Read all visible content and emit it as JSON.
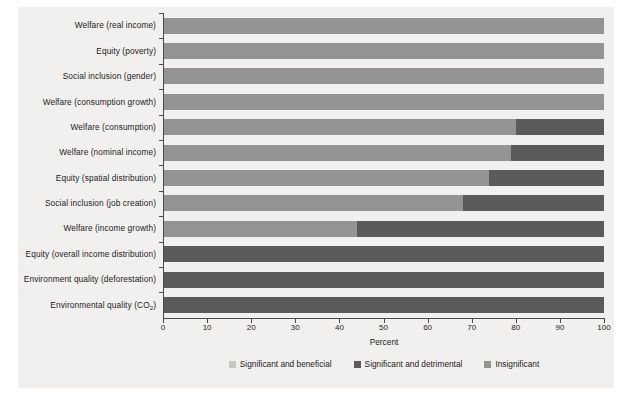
{
  "chart_data": {
    "type": "bar",
    "orientation": "horizontal",
    "stacked": true,
    "title": "",
    "xlabel": "Percent",
    "ylabel": "",
    "xlim": [
      0,
      100
    ],
    "xticks": [
      0,
      10,
      20,
      30,
      40,
      50,
      60,
      70,
      80,
      90,
      100
    ],
    "grid": false,
    "legend_position": "bottom-center",
    "categories": [
      "Welfare (real income)",
      "Equity (poverty)",
      "Social inclusion (gender)",
      "Welfare (consumption growth)",
      "Welfare (consumption)",
      "Welfare (nominal income)",
      "Equity (spatial distribution)",
      "Social inclusion (job creation)",
      "Welfare (income growth)",
      "Equity (overall income distribution)",
      "Environment quality (deforestation)",
      "Environmental quality (CO2)"
    ],
    "series": [
      {
        "name": "Significant and beneficial",
        "color": "#c9c8c5",
        "values": [
          0,
          0,
          0,
          0,
          0,
          0,
          0,
          0,
          0,
          0,
          0,
          0
        ]
      },
      {
        "name": "Significant and detrimental",
        "color": "#5b5b5b",
        "values": [
          0,
          0,
          0,
          0,
          20,
          21,
          26,
          32,
          56,
          100,
          100,
          100
        ]
      },
      {
        "name": "Insignificant",
        "color": "#949492",
        "values": [
          100,
          100,
          100,
          100,
          80,
          79,
          74,
          68,
          44,
          0,
          0,
          0
        ]
      }
    ],
    "stack_order": [
      "Insignificant",
      "Significant and detrimental"
    ]
  },
  "axis": {
    "x_title": "Percent",
    "tick_labels": [
      "0",
      "10",
      "20",
      "30",
      "40",
      "50",
      "60",
      "70",
      "80",
      "90",
      "100"
    ]
  },
  "legend": {
    "items": [
      {
        "label": "Significant and beneficial",
        "color": "#c9c8c5"
      },
      {
        "label": "Significant and detrimental",
        "color": "#5b5b5b"
      },
      {
        "label": "Insignificant",
        "color": "#949492"
      }
    ]
  },
  "labels": {
    "r0": "Welfare (real income)",
    "r1": "Equity (poverty)",
    "r2": "Social inclusion (gender)",
    "r3": "Welfare (consumption growth)",
    "r4": "Welfare (consumption)",
    "r5": "Welfare (nominal income)",
    "r6": "Equity (spatial distribution)",
    "r7": "Social inclusion (job creation)",
    "r8": "Welfare (income growth)",
    "r9": "Equity (overall income distribution)",
    "r10": "Environment quality (deforestation)",
    "r11_main": "Environmental quality (CO",
    "r11_sub": "2",
    "r11_tail": ")"
  }
}
